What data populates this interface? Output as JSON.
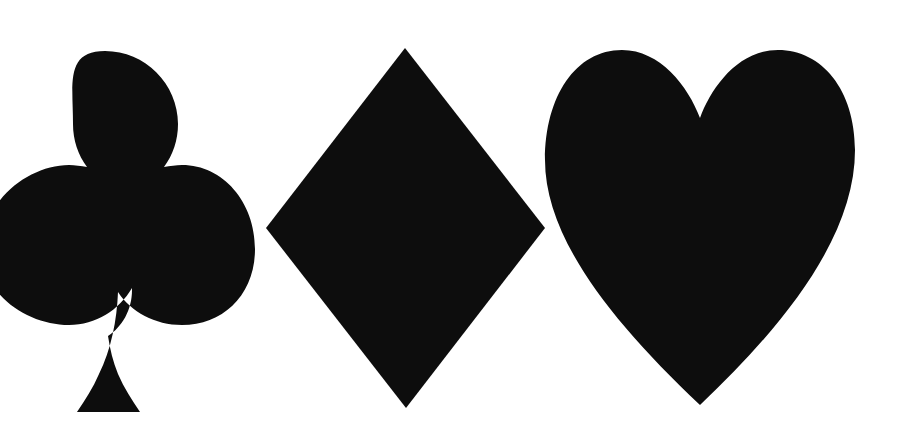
{
  "canvas": {
    "width": 905,
    "height": 436,
    "background_color": "#ffffff",
    "shape_color": "#0d0d0d"
  },
  "figure": {
    "shape_count": 3
  },
  "shapes": [
    {
      "id": "club",
      "name": "club",
      "label": "Club",
      "unicode": "♣",
      "fill": "#0d0d0d",
      "clipped": true,
      "clipped_edge": "left",
      "bounds": {
        "x": 0,
        "y": 51,
        "width": 255,
        "height": 361
      },
      "geometry": {
        "top_lobe": {
          "cx": 105,
          "cy": 124,
          "r": 73
        },
        "left_lobe": {
          "cx": 30,
          "cy": 250,
          "r": 76
        },
        "right_lobe": {
          "cx": 179,
          "cy": 249,
          "r": 76
        },
        "stem_base": {
          "x1": 67,
          "x2": 150,
          "y": 412
        }
      },
      "path": "M 105 51 C 145 51 178 84 178 124 C 178 140 173 155 164 167 C 170 166 176 165 182 165 C 223 165 255 202 255 249 C 255 295 223 325 182 325 C 155 325 131 312 118 292 C 117 320 111 350 99 374 C 93 388 85 400 77 412 L 67 412 L 150 412 L 140 412 C 132 400 124 388 118 374 C 113 362 110 349 108 336 C 122 327 132 310 132 290 L 132 288 C 119 310 96 325 69 325 C 28 325 -18 295 -18 249 C -18 202 28 165 69 165 C 75 165 81 166 87 167 C 78 155 73 140 73 124 C 73 84 65 51 105 51 Z"
    },
    {
      "id": "diamond",
      "name": "diamond",
      "label": "Diamond",
      "unicode": "♦",
      "fill": "#0d0d0d",
      "clipped": false,
      "bounds": {
        "x": 266,
        "y": 48,
        "width": 279,
        "height": 360
      },
      "geometry": {
        "top_tip": {
          "x": 405,
          "y": 48
        },
        "right_tip": {
          "x": 545,
          "y": 228
        },
        "bottom_tip": {
          "x": 406,
          "y": 408
        },
        "left_tip": {
          "x": 266,
          "y": 228
        }
      },
      "path": "M 405 48 L 545 228 L 406 408 L 266 228 Z"
    },
    {
      "id": "heart",
      "name": "heart",
      "label": "Heart",
      "unicode": "♥",
      "fill": "#0d0d0d",
      "clipped": false,
      "bounds": {
        "x": 545,
        "y": 50,
        "width": 310,
        "height": 355
      },
      "geometry": {
        "notch_bottom": {
          "x": 700,
          "y": 118
        },
        "bottom_tip": {
          "x": 700,
          "y": 405
        },
        "left_extreme": {
          "x": 545,
          "y": 160
        },
        "right_extreme": {
          "x": 855,
          "y": 150
        }
      },
      "path": "M 700 118 C 688 86 660 50 622 50 C 576 50 545 96 545 160 C 545 236 608 318 700 405 C 792 318 855 232 855 150 C 855 90 822 50 778 50 C 738 50 711 88 700 118 Z"
    }
  ]
}
